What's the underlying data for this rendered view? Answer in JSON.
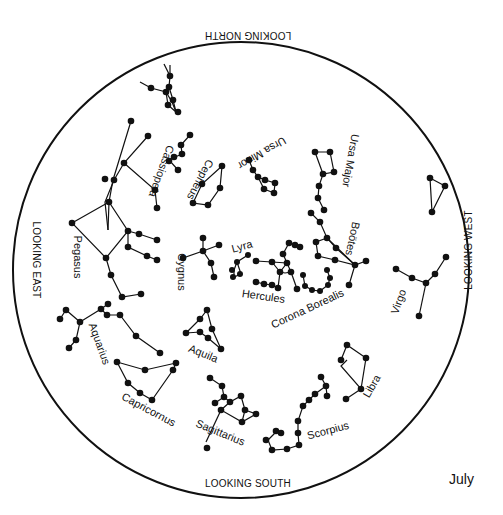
{
  "month": "July",
  "directions": {
    "north": "LOOKING NORTH",
    "south": "LOOKING SOUTH",
    "east": "LOOKING EAST",
    "west": "LOOKING WEST"
  },
  "colors": {
    "ink": "#111111",
    "background": "#ffffff"
  },
  "constellations": [
    {
      "name": "Cassiopeia",
      "label": "Cassiopeia"
    },
    {
      "name": "Cepheus",
      "label": "Cepheus"
    },
    {
      "name": "Ursa Minor",
      "label": "Ursa Minor"
    },
    {
      "name": "Ursa Major",
      "label": "Ursa Major"
    },
    {
      "name": "Bootes",
      "label": "Boötes"
    },
    {
      "name": "Pegasus",
      "label": "Pegasus"
    },
    {
      "name": "Cygnus",
      "label": "Cygnus"
    },
    {
      "name": "Lyra",
      "label": "Lyra"
    },
    {
      "name": "Hercules",
      "label": "Hercules"
    },
    {
      "name": "Corona Borealis",
      "label": "Corona Borealis"
    },
    {
      "name": "Virgo",
      "label": "Virgo"
    },
    {
      "name": "Aquarius",
      "label": "Aquarius"
    },
    {
      "name": "Aquila",
      "label": "Aquila"
    },
    {
      "name": "Capricornus",
      "label": "Capricornus"
    },
    {
      "name": "Sagittarius",
      "label": "Sagittarius"
    },
    {
      "name": "Scorpius",
      "label": "Scorpius"
    },
    {
      "name": "Libra",
      "label": "Libra"
    }
  ]
}
